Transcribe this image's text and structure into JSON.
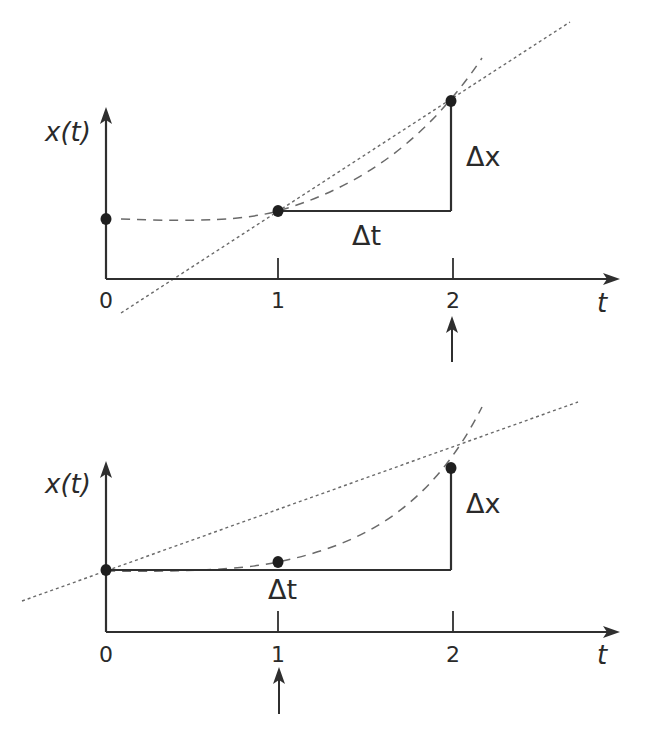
{
  "figure": {
    "panels": [
      {
        "name": "secant-panel-top",
        "y_axis_label": "x(t)",
        "x_axis_label": "t",
        "tick_labels": [
          "0",
          "1",
          "2"
        ],
        "delta_t_label": "Δt",
        "delta_x_label": "Δx",
        "interval": [
          1,
          2
        ],
        "indicated_time": "2",
        "geometry": {
          "origin": [
            106,
            279
          ],
          "y_axis_top": 107,
          "x_axis_right": 620,
          "tick_x": [
            106,
            278,
            453
          ],
          "points": [
            [
              106,
              219
            ],
            [
              278,
              211
            ],
            [
              451,
              101
            ]
          ],
          "secant": [
            [
              121,
              313
            ],
            [
              570,
              22
            ]
          ],
          "curve": "M 121 219 C 200 222, 245 220, 278 211 C 350 190, 420 150, 482 58",
          "delta_t": [
            [
              278,
              211
            ],
            [
              451,
              211
            ]
          ],
          "delta_x": [
            [
              451,
              211
            ],
            [
              451,
              101
            ]
          ],
          "indicator_x": 452,
          "indicator_y": [
            316,
            362
          ],
          "labels": {
            "y_axis": [
              45,
              141
            ],
            "x_axis": [
              597,
              312
            ],
            "ticks_y": 308,
            "delta_t": [
              352,
              245
            ],
            "delta_x": [
              466,
              166
            ]
          }
        }
      },
      {
        "name": "secant-panel-bottom",
        "y_axis_label": "x(t)",
        "x_axis_label": "t",
        "tick_labels": [
          "0",
          "1",
          "2"
        ],
        "delta_t_label": "Δt",
        "delta_x_label": "Δx",
        "interval": [
          0,
          2
        ],
        "indicated_time": "1",
        "geometry": {
          "origin": [
            106,
            632
          ],
          "y_axis_top": 461,
          "x_axis_right": 620,
          "tick_x": [
            106,
            278,
            453
          ],
          "points": [
            [
              106,
              570
            ],
            [
              278,
              562
            ],
            [
              451,
              468
            ]
          ],
          "secant": [
            [
              22,
              601
            ],
            [
              578,
              402
            ]
          ],
          "curve": "M 106 571 C 180 572, 240 570, 278 562 C 360 545, 430 510, 482 407",
          "delta_t": [
            [
              106,
              570
            ],
            [
              451,
              570
            ]
          ],
          "delta_x": [
            [
              451,
              570
            ],
            [
              451,
              468
            ]
          ],
          "indicator_x": 279,
          "indicator_y": [
            667,
            714
          ],
          "labels": {
            "y_axis": [
              45,
              493
            ],
            "x_axis": [
              597,
              664
            ],
            "ticks_y": 662,
            "delta_t": [
              268,
              599
            ],
            "delta_x": [
              466,
              513
            ]
          }
        }
      }
    ]
  },
  "colors": {
    "background": "#ffffff",
    "ink": "#2f2f2f",
    "guide": "#6a6a6a"
  }
}
